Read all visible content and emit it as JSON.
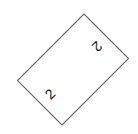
{
  "card": {
    "top_label": "2",
    "bottom_label": "2",
    "border_color": "#555555",
    "rotation_deg": 45
  }
}
